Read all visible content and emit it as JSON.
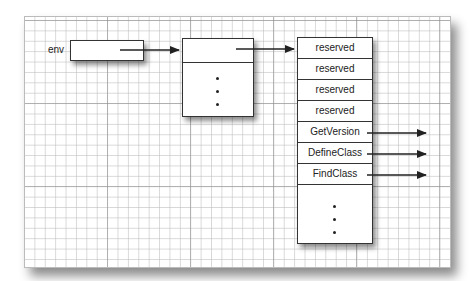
{
  "diagram": {
    "env_label": "env",
    "table_rows": [
      {
        "label": "reserved",
        "has_pointer": false
      },
      {
        "label": "reserved",
        "has_pointer": false
      },
      {
        "label": "reserved",
        "has_pointer": false
      },
      {
        "label": "reserved",
        "has_pointer": false
      },
      {
        "label": "GetVersion",
        "has_pointer": true
      },
      {
        "label": "DefineClass",
        "has_pointer": true
      },
      {
        "label": "FindClass",
        "has_pointer": true
      }
    ],
    "ellipsis": "⋮"
  }
}
